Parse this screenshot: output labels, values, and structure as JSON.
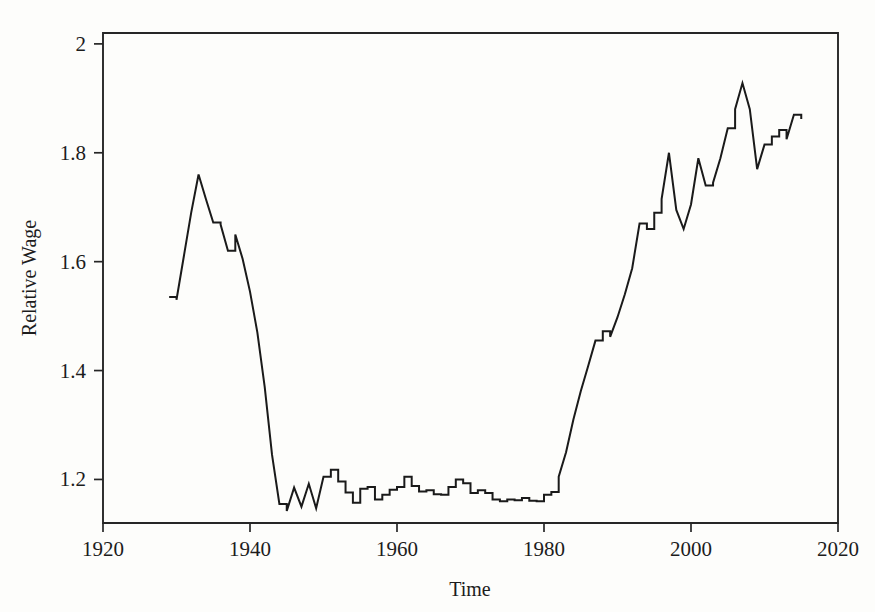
{
  "figure": {
    "background_color": "#fdfdfb",
    "line_color": "#1a1a1a",
    "axis_color": "#262626"
  },
  "axes": {
    "x_title": "Time",
    "y_title": "Relative Wage",
    "x_ticks": [
      "1920",
      "1940",
      "1960",
      "1980",
      "2000",
      "2020"
    ],
    "y_ticks": [
      "1.2",
      "1.4",
      "1.6",
      "1.8",
      "2"
    ]
  },
  "chart_data": {
    "type": "line",
    "title": "",
    "xlabel": "Time",
    "ylabel": "Relative Wage",
    "xlim": [
      1920,
      2020
    ],
    "ylim": [
      1.12,
      2.02
    ],
    "grid": false,
    "legend": "none",
    "x_ticks": [
      1920,
      1940,
      1960,
      1980,
      2000,
      2020
    ],
    "y_ticks": [
      1.2,
      1.4,
      1.6,
      1.8,
      2.0
    ],
    "series": [
      {
        "name": "Relative Wage",
        "x": [
          1929,
          1930,
          1931,
          1932,
          1933,
          1934,
          1935,
          1936,
          1937,
          1938,
          1939,
          1940,
          1941,
          1942,
          1943,
          1944,
          1945,
          1946,
          1947,
          1948,
          1949,
          1950,
          1951,
          1952,
          1953,
          1954,
          1955,
          1956,
          1957,
          1958,
          1959,
          1960,
          1961,
          1962,
          1963,
          1964,
          1965,
          1966,
          1967,
          1968,
          1969,
          1970,
          1971,
          1972,
          1973,
          1974,
          1975,
          1976,
          1977,
          1978,
          1979,
          1980,
          1981,
          1982,
          1983,
          1984,
          1985,
          1986,
          1987,
          1988,
          1989,
          1990,
          1991,
          1992,
          1993,
          1994,
          1995,
          1996,
          1997,
          1998,
          1999,
          2000,
          2001,
          2002,
          2003,
          2004,
          2005,
          2006,
          2007,
          2008,
          2009,
          2010,
          2011,
          2012,
          2013,
          2014,
          2015
        ],
        "values": [
          1.535,
          1.53,
          1.61,
          1.69,
          1.76,
          1.715,
          1.672,
          1.668,
          1.62,
          1.65,
          1.605,
          1.545,
          1.47,
          1.37,
          1.245,
          1.155,
          1.142,
          1.185,
          1.15,
          1.192,
          1.147,
          1.205,
          1.218,
          1.196,
          1.176,
          1.157,
          1.183,
          1.186,
          1.163,
          1.172,
          1.181,
          1.186,
          1.205,
          1.188,
          1.178,
          1.18,
          1.173,
          1.172,
          1.186,
          1.2,
          1.193,
          1.175,
          1.18,
          1.175,
          1.163,
          1.16,
          1.163,
          1.162,
          1.166,
          1.161,
          1.16,
          1.172,
          1.177,
          1.205,
          1.25,
          1.31,
          1.362,
          1.408,
          1.455,
          1.472,
          1.462,
          1.498,
          1.54,
          1.588,
          1.67,
          1.66,
          1.69,
          1.715,
          1.8,
          1.695,
          1.66,
          1.705,
          1.79,
          1.74,
          1.745,
          1.79,
          1.845,
          1.88,
          1.928,
          1.88,
          1.77,
          1.815,
          1.83,
          1.842,
          1.825,
          1.87,
          1.862
        ]
      }
    ]
  }
}
